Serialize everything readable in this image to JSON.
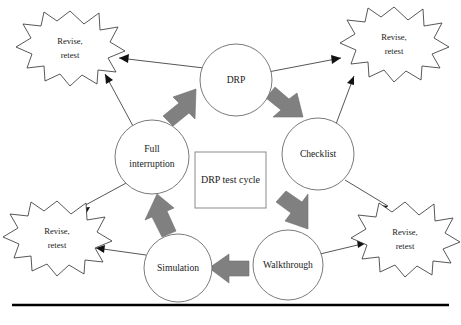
{
  "figure": {
    "title": "DRP test cycle",
    "type": "cycle-diagram",
    "background_color": "#ffffff",
    "accent_color": "#808080",
    "outline_color": "#3a3a3a",
    "text_color": "#1a1a1a"
  },
  "center": {
    "label": "DRP test cycle"
  },
  "nodes": [
    {
      "id": "drp",
      "label": "DRP",
      "label_line1": "DRP",
      "label_line2": "",
      "cx": 236,
      "cy": 80,
      "r": 36
    },
    {
      "id": "checklist",
      "label": "Checklist",
      "label_line1": "Checklist",
      "label_line2": "",
      "cx": 318,
      "cy": 154,
      "r": 36
    },
    {
      "id": "walkthrough",
      "label": "Walkthrough",
      "label_line1": "Walkthrough",
      "label_line2": "",
      "cx": 288,
      "cy": 265,
      "r": 35
    },
    {
      "id": "simulation",
      "label": "Simulation",
      "label_line1": "Simulation",
      "label_line2": "",
      "cx": 178,
      "cy": 268,
      "r": 34
    },
    {
      "id": "full-interruption",
      "label": "Full interruption",
      "label_line1": "Full",
      "label_line2": "interruption",
      "cx": 152,
      "cy": 157,
      "r": 37
    }
  ],
  "bursts": [
    {
      "id": "burst-top-left",
      "line1": "Revise,",
      "line2": "retest",
      "cx": 70,
      "cy": 47,
      "rx": 52,
      "ry": 36
    },
    {
      "id": "burst-top-right",
      "line1": "Revise,",
      "line2": "retest",
      "cx": 394,
      "cy": 43,
      "rx": 52,
      "ry": 36
    },
    {
      "id": "burst-bottom-left",
      "line1": "Revise,",
      "line2": "retest",
      "cx": 57,
      "cy": 237,
      "rx": 52,
      "ry": 36
    },
    {
      "id": "burst-bottom-right",
      "line1": "Revise,",
      "line2": "retest",
      "cx": 405,
      "cy": 238,
      "rx": 52,
      "ry": 36
    }
  ],
  "cycle_arrows": [
    {
      "id": "arrow-fullinterruption-to-drp",
      "from": "full-interruption",
      "to": "drp",
      "direction": "up-right",
      "color": "#808080"
    },
    {
      "id": "arrow-drp-to-checklist",
      "from": "drp",
      "to": "checklist",
      "direction": "down-right",
      "color": "#808080"
    },
    {
      "id": "arrow-checklist-to-walkthrough",
      "from": "checklist",
      "to": "walkthrough",
      "direction": "down",
      "color": "#808080"
    },
    {
      "id": "arrow-walkthrough-to-simulation",
      "from": "walkthrough",
      "to": "simulation",
      "direction": "left",
      "color": "#808080"
    },
    {
      "id": "arrow-simulation-to-fullinterruption",
      "from": "simulation",
      "to": "full-interruption",
      "direction": "up",
      "color": "#808080"
    }
  ],
  "revise_links": [
    {
      "id": "link-drp-to-top-left",
      "from": "drp",
      "to": "burst-top-left"
    },
    {
      "id": "link-drp-to-top-right",
      "from": "drp",
      "to": "burst-top-right"
    },
    {
      "id": "link-fullinterruption-to-top-left",
      "from": "full-interruption",
      "to": "burst-top-left"
    },
    {
      "id": "link-fullinterruption-to-bottom-left",
      "from": "full-interruption",
      "to": "burst-bottom-left"
    },
    {
      "id": "link-checklist-to-top-right",
      "from": "checklist",
      "to": "burst-top-right"
    },
    {
      "id": "link-checklist-to-bottom-right",
      "from": "checklist",
      "to": "burst-bottom-right"
    },
    {
      "id": "link-simulation-to-bottom-left",
      "from": "simulation",
      "to": "burst-bottom-left"
    },
    {
      "id": "link-walkthrough-to-bottom-right",
      "from": "walkthrough",
      "to": "burst-bottom-right"
    }
  ],
  "rule": {
    "x1": 12,
    "x2": 449,
    "y": 305
  }
}
